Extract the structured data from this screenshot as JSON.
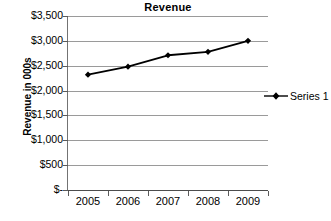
{
  "chart_data": {
    "type": "line",
    "title": "Revenue",
    "xlabel": "",
    "ylabel": "Revenue in 000s",
    "categories": [
      "2005",
      "2006",
      "2007",
      "2008",
      "2009"
    ],
    "series": [
      {
        "name": "Series 1",
        "values": [
          2320,
          2480,
          2710,
          2780,
          3000
        ]
      }
    ],
    "ylim": [
      0,
      3500
    ],
    "ytick_values": [
      0,
      500,
      1000,
      1500,
      2000,
      2500,
      3000,
      3500
    ],
    "ytick_labels": [
      "$-",
      "$500",
      "$1,000",
      "$1,500",
      "$2,000",
      "$2,500",
      "$3,000",
      "$3,500"
    ],
    "grid": true,
    "legend_position": "right",
    "marker": "diamond",
    "line_color": "#000000",
    "grid_color": "#9a9a9a",
    "background_color": "#ffffff"
  },
  "legend": {
    "entries": [
      {
        "label": "Series 1"
      }
    ]
  }
}
